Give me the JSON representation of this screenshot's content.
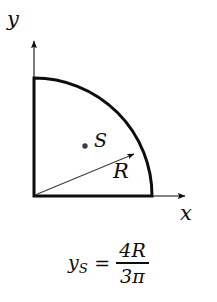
{
  "figure": {
    "kind": "centroid-of-quarter-circle-diagram",
    "background_color": "#ffffff",
    "ink_color": "#0d0d0d"
  },
  "axes": {
    "y_label": "y",
    "x_label": "x",
    "origin_px": [
      34,
      196
    ],
    "y_axis_tip_px": [
      34,
      36
    ],
    "x_axis_tip_px": [
      191,
      196
    ]
  },
  "shape": {
    "name": "quarter-circle",
    "radius_px": 118,
    "arc_start_px": [
      34,
      78
    ],
    "arc_end_px": [
      152,
      196
    ],
    "outline_width_px": 3
  },
  "centroid": {
    "label": "S",
    "marker": "dot",
    "position_px": [
      85,
      146
    ]
  },
  "radius_annotation": {
    "label": "R",
    "from_px": [
      34,
      196
    ],
    "to_px": [
      137,
      153
    ],
    "arrow": "tip-at-arc"
  },
  "formula": {
    "lhs_variable": "y",
    "lhs_subscript": "S",
    "equals": "=",
    "numerator": "4R",
    "denominator": "3π",
    "plain_text": "y_S = 4R / (3π)"
  }
}
